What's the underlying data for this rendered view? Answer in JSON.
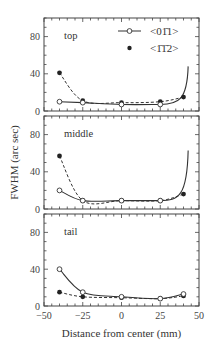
{
  "chart_data": {
    "type": "line",
    "xlabel": "Distance from center (mm)",
    "ylabel": "FWHM (arc sec)",
    "xlim": [
      -50,
      50
    ],
    "ylim": [
      0,
      100
    ],
    "xticks": [
      "−50",
      "−25",
      "0",
      "25",
      "50"
    ],
    "yticks": [
      "0",
      "40",
      "80"
    ],
    "legend": [
      {
        "name": "<01̄1>",
        "marker": "open-circle",
        "line": "solid"
      },
      {
        "name": "<1̄1̄2>",
        "marker": "filled-circle",
        "line": "dashed"
      }
    ],
    "panels": [
      {
        "label": "top",
        "x": [
          -40,
          -25,
          0,
          25,
          40
        ],
        "series": [
          {
            "name": "<01̄1>",
            "values": [
              10,
              9,
              7,
              7,
              null
            ],
            "curve_end": [
              43,
              48
            ]
          },
          {
            "name": "<1̄1̄2>",
            "values": [
              41,
              11,
              9,
              10,
              15
            ]
          }
        ]
      },
      {
        "label": "middle",
        "x": [
          -40,
          -25,
          0,
          25,
          40
        ],
        "series": [
          {
            "name": "<01̄1>",
            "values": [
              20,
              9,
              9,
              9,
              null
            ],
            "curve_end": [
              43,
              63
            ]
          },
          {
            "name": "<1̄1̄2>",
            "values": [
              57,
              9,
              9,
              9,
              16
            ]
          }
        ]
      },
      {
        "label": "tail",
        "x": [
          -40,
          -25,
          0,
          25,
          40
        ],
        "series": [
          {
            "name": "<01̄1>",
            "values": [
              40,
              15,
              10,
              8,
              13
            ]
          },
          {
            "name": "<1̄1̄2>",
            "values": [
              15,
              10,
              9,
              8,
              11
            ]
          }
        ]
      }
    ]
  }
}
